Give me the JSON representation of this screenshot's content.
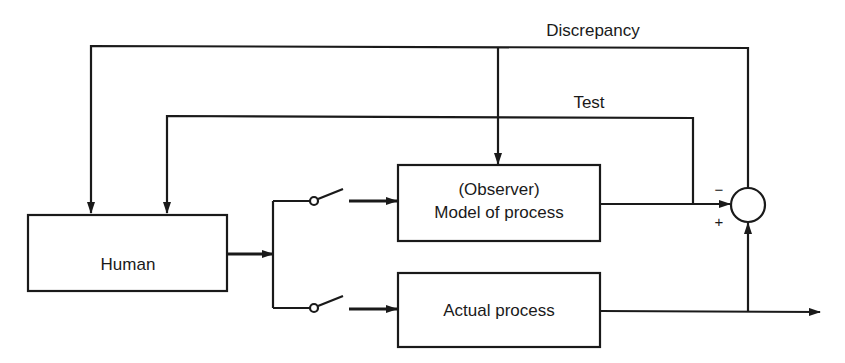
{
  "diagram": {
    "type": "block-diagram",
    "colors": {
      "line": "#1a1a1a",
      "background": "#ffffff"
    },
    "blocks": {
      "human": {
        "label": "Human"
      },
      "model": {
        "label_line1": "(Observer)",
        "label_line2": "Model of process"
      },
      "actual": {
        "label": "Actual process"
      }
    },
    "signals": {
      "discrepancy": "Discrepancy",
      "test": "Test"
    },
    "summing_junction": {
      "minus_sign": "−",
      "plus_sign": "+"
    }
  }
}
